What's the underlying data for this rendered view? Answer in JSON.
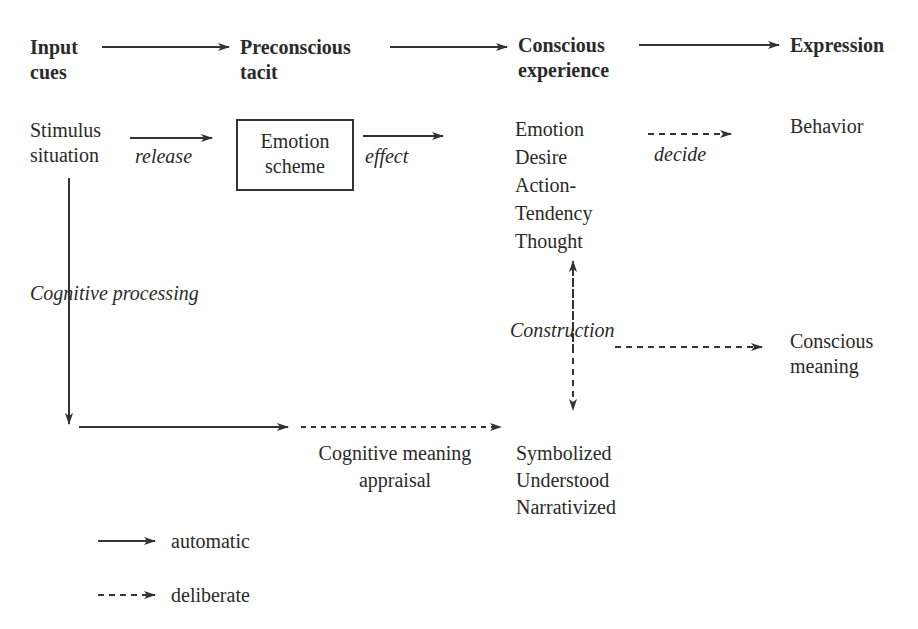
{
  "headers": {
    "input": [
      "Input",
      "cues"
    ],
    "preconscious": [
      "Preconscious",
      "tacit"
    ],
    "conscious": [
      "Conscious",
      "experience"
    ],
    "expression": [
      "Expression"
    ]
  },
  "nodes": {
    "stimulus": [
      "Stimulus",
      "situation"
    ],
    "emotion_scheme": [
      "Emotion",
      "scheme"
    ],
    "conscious_items": [
      "Emotion",
      "Desire",
      "Action-",
      "Tendency",
      "Thought"
    ],
    "behavior": "Behavior",
    "conscious_meaning": [
      "Conscious",
      "meaning"
    ],
    "cognitive_appraisal": [
      "Cognitive meaning",
      "appraisal"
    ],
    "symbolized": [
      "Symbolized",
      "Understood",
      "Narrativized"
    ]
  },
  "edge_labels": {
    "release": "release",
    "effect": "effect",
    "decide": "decide",
    "cognitive_processing": "Cognitive processing",
    "construction": "Construction"
  },
  "legend": {
    "automatic": "automatic",
    "deliberate": "deliberate"
  },
  "colors": {
    "ink": "#2a2a2a",
    "background": "#ffffff"
  }
}
